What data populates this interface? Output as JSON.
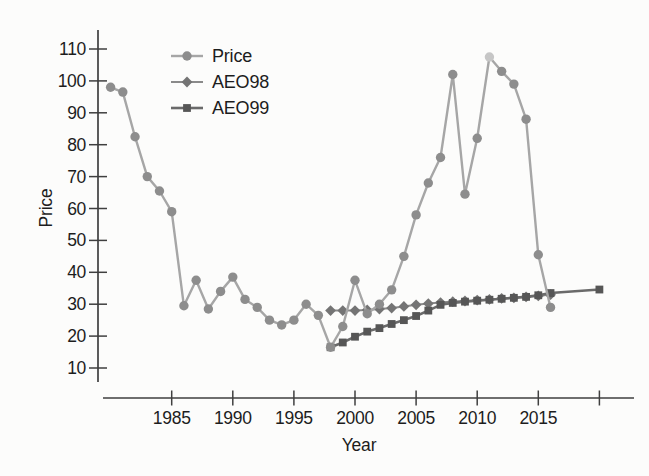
{
  "figure": {
    "background": "#fcfcfb",
    "text_color": "#1d1d1d",
    "axis_color": "#3f3f3f"
  },
  "chart_data": {
    "type": "line",
    "title": "",
    "xlabel": "Year",
    "ylabel": "Price",
    "x_range": [
      1979,
      2022
    ],
    "y_range": [
      10,
      110
    ],
    "grid": false,
    "legend_position": "top-left-inside",
    "y_ticks": [
      10,
      20,
      30,
      40,
      50,
      60,
      70,
      80,
      90,
      100,
      110
    ],
    "x_ticks": [
      {
        "year": 1985,
        "label": "1985"
      },
      {
        "year": 1990,
        "label": "1990"
      },
      {
        "year": 1995,
        "label": "1995"
      },
      {
        "year": 2000,
        "label": "2000"
      },
      {
        "year": 2005,
        "label": "2005"
      },
      {
        "year": 2010,
        "label": "2010"
      },
      {
        "year": 2015,
        "label": "2015"
      },
      {
        "year": 2020,
        "label": ""
      }
    ],
    "series": [
      {
        "name": "AEO98",
        "marker": "diamond",
        "line_color": "#8a8a8a",
        "marker_color": "#747474",
        "line_width": 2,
        "points": [
          [
            1998,
            28
          ],
          [
            1999,
            28
          ],
          [
            2000,
            28
          ],
          [
            2001,
            28.2
          ],
          [
            2002,
            28.5
          ],
          [
            2003,
            28.8
          ],
          [
            2004,
            29.3
          ],
          [
            2005,
            29.8
          ],
          [
            2006,
            30.2
          ],
          [
            2007,
            30.5
          ],
          [
            2008,
            30.8
          ],
          [
            2009,
            31
          ],
          [
            2010,
            31.3
          ],
          [
            2011,
            31.5
          ],
          [
            2012,
            31.8
          ],
          [
            2013,
            32
          ],
          [
            2014,
            32.3
          ],
          [
            2015,
            32.6
          ],
          [
            2016,
            33
          ]
        ]
      },
      {
        "name": "AEO99",
        "marker": "square",
        "line_color": "#6a6a6a",
        "marker_color": "#565656",
        "line_width": 2.6,
        "points": [
          [
            1998,
            16.5
          ],
          [
            1999,
            18
          ],
          [
            2000,
            19.8
          ],
          [
            2001,
            21.4
          ],
          [
            2002,
            22.5
          ],
          [
            2003,
            23.8
          ],
          [
            2004,
            25
          ],
          [
            2005,
            26.3
          ],
          [
            2006,
            28
          ],
          [
            2007,
            29.8
          ],
          [
            2008,
            30.4
          ],
          [
            2009,
            30.8
          ],
          [
            2010,
            31.1
          ],
          [
            2011,
            31.4
          ],
          [
            2012,
            31.7
          ],
          [
            2013,
            32
          ],
          [
            2014,
            32.3
          ],
          [
            2015,
            32.8
          ],
          [
            2016,
            33.5
          ],
          [
            2020,
            34.6
          ]
        ]
      },
      {
        "name": "Price",
        "marker": "circle",
        "line_color": "#a6a6a6",
        "marker_color": "#8d8d8d",
        "line_width": 2.4,
        "highlight": {
          "year": 2011,
          "color": "#c6c6c6"
        },
        "points": [
          [
            1980,
            98
          ],
          [
            1981,
            96.5
          ],
          [
            1982,
            82.5
          ],
          [
            1983,
            70
          ],
          [
            1984,
            65.5
          ],
          [
            1985,
            59
          ],
          [
            1986,
            29.5
          ],
          [
            1987,
            37.5
          ],
          [
            1988,
            28.5
          ],
          [
            1989,
            34
          ],
          [
            1990,
            38.5
          ],
          [
            1991,
            31.5
          ],
          [
            1992,
            29
          ],
          [
            1993,
            25
          ],
          [
            1994,
            23.5
          ],
          [
            1995,
            25
          ],
          [
            1996,
            30
          ],
          [
            1997,
            26.5
          ],
          [
            1998,
            16.5
          ],
          [
            1999,
            23
          ],
          [
            2000,
            37.5
          ],
          [
            2001,
            27
          ],
          [
            2002,
            30
          ],
          [
            2003,
            34.5
          ],
          [
            2004,
            45
          ],
          [
            2005,
            58
          ],
          [
            2006,
            68
          ],
          [
            2007,
            76
          ],
          [
            2008,
            102
          ],
          [
            2009,
            64.5
          ],
          [
            2010,
            82
          ],
          [
            2011,
            107.5
          ],
          [
            2012,
            103
          ],
          [
            2013,
            99
          ],
          [
            2014,
            88
          ],
          [
            2015,
            45.5
          ],
          [
            2016,
            29
          ]
        ]
      }
    ],
    "legend_order": [
      "Price",
      "AEO98",
      "AEO99"
    ]
  }
}
